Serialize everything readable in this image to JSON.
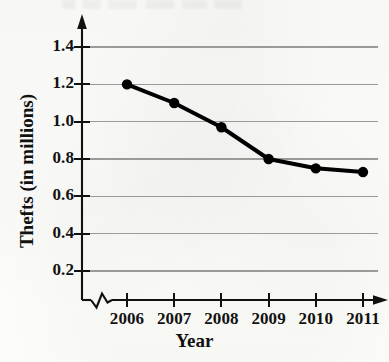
{
  "chart_data": {
    "type": "line",
    "title": "",
    "xlabel": "Year",
    "ylabel": "Thefts (in millions)",
    "categories": [
      "2006",
      "2007",
      "2008",
      "2009",
      "2010",
      "2011"
    ],
    "x": [
      2006,
      2007,
      2008,
      2009,
      2010,
      2011
    ],
    "values": [
      1.2,
      1.1,
      0.97,
      0.8,
      0.75,
      0.73
    ],
    "series": [
      {
        "name": "Thefts",
        "values": [
          1.2,
          1.1,
          0.97,
          0.8,
          0.75,
          0.73
        ],
        "color": "#000000",
        "marker": "filled-circle",
        "line_width": 4
      }
    ],
    "yticks": [
      "0.2",
      "0.4",
      "0.6",
      "0.8",
      "1.0",
      "1.2",
      "1.4"
    ],
    "ytick_values": [
      0.2,
      0.4,
      0.6,
      0.8,
      1.0,
      1.2,
      1.4
    ],
    "ylim": [
      0.0,
      1.5
    ],
    "xlim": [
      2005.55,
      2011.6
    ],
    "grid": "horizontal",
    "grid_color": "#9a9a9a",
    "legend": "none",
    "axis_break": "x-axis zigzag between origin and 2006",
    "axis_arrows": [
      "y-axis-top",
      "x-axis-right"
    ],
    "background_color": "#fdfdfb",
    "text_color": "#111111"
  },
  "axes": {
    "x_title": "Year",
    "y_title": "Thefts (in millions)"
  }
}
